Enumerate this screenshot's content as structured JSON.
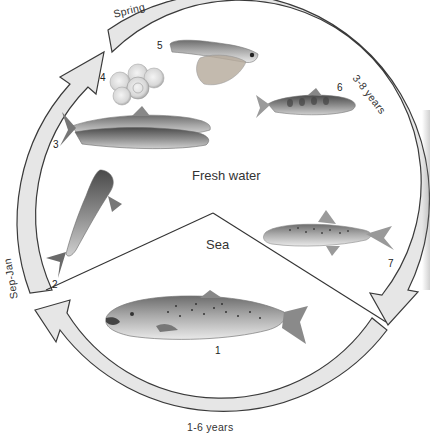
{
  "diagram": {
    "regions": {
      "fresh_water": "Fresh water",
      "sea": "Sea"
    },
    "seasons": {
      "spring": "Spring",
      "sep_jan": "Sep-Jan"
    },
    "durations": {
      "fresh_water_years": "3-8 years",
      "sea_years": "1-6 years"
    },
    "stages": [
      {
        "number": "1",
        "icon": "adult-salmon-at-sea"
      },
      {
        "number": "2",
        "icon": "salmon-leaping-upstream"
      },
      {
        "number": "3",
        "icon": "spawning-salmon-pair"
      },
      {
        "number": "4",
        "icon": "eggs-cluster"
      },
      {
        "number": "5",
        "icon": "alevin-with-yolk-sac"
      },
      {
        "number": "6",
        "icon": "parr"
      },
      {
        "number": "7",
        "icon": "smolt"
      }
    ],
    "colors": {
      "ring_fill": "#e6e6e6",
      "ring_stroke": "#3a3a3a",
      "line": "#333333",
      "fish_dark": "#5a5a5a",
      "fish_light": "#bdbdbd"
    }
  }
}
